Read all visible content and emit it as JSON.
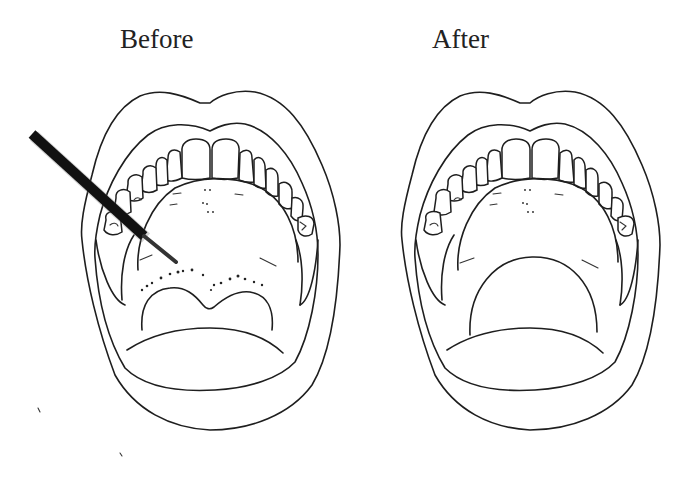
{
  "figure": {
    "panels": [
      {
        "label": "Before",
        "shows_instrument": true,
        "shows_lesions": true
      },
      {
        "label": "After",
        "shows_instrument": false,
        "shows_lesions": false
      }
    ],
    "colors": {
      "line": "#1e1e1e",
      "background": "#ffffff",
      "instrument": "#111111"
    }
  }
}
